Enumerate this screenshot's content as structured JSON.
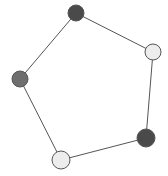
{
  "figure": {
    "name": "undirected-graph-pentagon",
    "width": 168,
    "height": 176,
    "background_color": "#ffffff",
    "title": "",
    "caption": ""
  },
  "style": {
    "edge_color": "#555555",
    "edge_width": 1,
    "node_stroke_color": "#555555",
    "node_stroke_width": 1,
    "shade_dark": "#4a4a4a",
    "shade_medium": "#6e6e6e",
    "shade_light": "#ededed"
  },
  "graph": {
    "node_count": 5,
    "edge_count": 5,
    "layout": "cycle",
    "nodes": [
      {
        "id": "n1",
        "label": "",
        "position_label": "top",
        "cx": 76,
        "cy": 13,
        "r": 8,
        "fill": "#4a4a4a",
        "shade": "dark"
      },
      {
        "id": "n2",
        "label": "",
        "position_label": "upper-right",
        "cx": 153,
        "cy": 52,
        "r": 8,
        "fill": "#ededed",
        "shade": "light"
      },
      {
        "id": "n3",
        "label": "",
        "position_label": "lower-right",
        "cx": 146,
        "cy": 138,
        "r": 9,
        "fill": "#4a4a4a",
        "shade": "dark"
      },
      {
        "id": "n4",
        "label": "",
        "position_label": "bottom-left",
        "cx": 61,
        "cy": 160,
        "r": 9,
        "fill": "#ededed",
        "shade": "light"
      },
      {
        "id": "n5",
        "label": "",
        "position_label": "left",
        "cx": 20,
        "cy": 79,
        "r": 8,
        "fill": "#6e6e6e",
        "shade": "medium"
      }
    ],
    "edges": [
      {
        "id": "e1",
        "source": "n1",
        "target": "n2",
        "x1": 76,
        "y1": 13,
        "x2": 153,
        "y2": 52
      },
      {
        "id": "e2",
        "source": "n2",
        "target": "n3",
        "x1": 153,
        "y1": 52,
        "x2": 146,
        "y2": 138
      },
      {
        "id": "e3",
        "source": "n3",
        "target": "n4",
        "x1": 146,
        "y1": 138,
        "x2": 61,
        "y2": 160
      },
      {
        "id": "e4",
        "source": "n4",
        "target": "n5",
        "x1": 61,
        "y1": 160,
        "x2": 20,
        "y2": 79
      },
      {
        "id": "e5",
        "source": "n5",
        "target": "n1",
        "x1": 20,
        "y1": 79,
        "x2": 76,
        "y2": 13
      }
    ]
  }
}
